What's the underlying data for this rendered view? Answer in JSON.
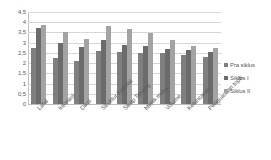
{
  "chart_data": {
    "type": "bar",
    "title": "",
    "xlabel": "",
    "ylabel": "",
    "ylim": [
      0,
      4.5
    ],
    "ytick_step": 0.5,
    "grid": true,
    "legend_position": "right",
    "decimal_separator": ",",
    "ytick_labels": [
      "4,5",
      "4",
      "3,5",
      "3",
      "2,5",
      "2",
      "1,5",
      "1",
      "0,5",
      "0"
    ],
    "ytick_values": [
      4.5,
      4,
      3.5,
      3,
      2.5,
      2,
      1.5,
      1,
      0.5,
      0
    ],
    "categories": [
      "Lafal",
      "Intonasi",
      "Diksi",
      "Struktur Kalimat",
      "Sikap Tenang",
      "Mimik muka",
      "Volume",
      "Kelancaran",
      "Penguasaan topik"
    ],
    "series": [
      {
        "name": "Pra siklus",
        "color": "#7f7f7f",
        "values": [
          2.75,
          2.25,
          2.1,
          2.6,
          2.55,
          2.5,
          2.5,
          2.4,
          2.3
        ]
      },
      {
        "name": "Siklus I",
        "color": "#6b6b6b",
        "values": [
          3.7,
          3.0,
          2.8,
          3.15,
          2.9,
          2.85,
          2.7,
          2.65,
          2.55
        ]
      },
      {
        "name": "Siklus II",
        "color": "#a3a3a3",
        "values": [
          3.85,
          3.5,
          3.2,
          3.8,
          3.65,
          3.45,
          3.15,
          2.85,
          2.75
        ]
      }
    ]
  },
  "legend": {
    "items": [
      {
        "label": "Pra siklus",
        "color": "#7f7f7f"
      },
      {
        "label": "Siklus I",
        "color": "#6b6b6b"
      },
      {
        "label": "Siklus II",
        "color": "#a3a3a3"
      }
    ]
  }
}
